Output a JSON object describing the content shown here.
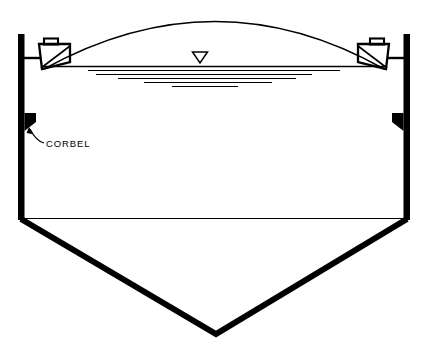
{
  "diagram": {
    "background_color": "#ffffff",
    "line_color": "#000000",
    "annotations": [
      {
        "id": "corbel",
        "label": "CORBEL",
        "label_x": 46,
        "label_y": 146,
        "leader": "curved arrow from label to left corbel bracket"
      }
    ],
    "symbols": [
      {
        "id": "water-level",
        "name": "water-level-triangle",
        "shape": "inverted-triangle",
        "center_x": 200,
        "top_y": 51,
        "width": 15,
        "height": 12
      }
    ],
    "structure": {
      "left_wall": {
        "x": 18,
        "y_top": 34,
        "y_bottom": 220,
        "thickness": 6
      },
      "right_wall": {
        "x": 404,
        "y_top": 34,
        "y_bottom": 220,
        "thickness": 6
      },
      "dome_apex_y": 17,
      "water_line_y": 66,
      "hopper_line_y": 218,
      "hopper_apex_x": 216,
      "hopper_apex_y": 334
    },
    "hatch_lines": [
      {
        "x1": 88,
        "x2": 340,
        "y": 70
      },
      {
        "x1": 96,
        "x2": 312,
        "y": 74
      },
      {
        "x1": 118,
        "x2": 296,
        "y": 78
      },
      {
        "x1": 144,
        "x2": 272,
        "y": 82
      },
      {
        "x1": 172,
        "x2": 238,
        "y": 86
      }
    ]
  }
}
